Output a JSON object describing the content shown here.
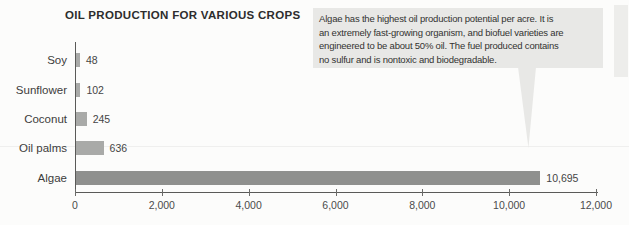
{
  "chart_data": {
    "type": "bar",
    "orientation": "horizontal",
    "title": "OIL PRODUCTION FOR VARIOUS CROPS",
    "categories": [
      "Soy",
      "Sunflower",
      "Coconut",
      "Oil palms",
      "Algae"
    ],
    "values": [
      48,
      102,
      245,
      636,
      10695
    ],
    "value_labels": [
      "48",
      "102",
      "245",
      "636",
      "10,695"
    ],
    "xlabel": "",
    "ylabel": "",
    "xlim": [
      0,
      12000
    ],
    "x_ticks": [
      0,
      2000,
      4000,
      6000,
      8000,
      10000,
      12000
    ],
    "x_tick_labels": [
      "0",
      "2,000",
      "4,000",
      "6,000",
      "8,000",
      "10,000",
      "12,000"
    ],
    "grid": false,
    "legend": false
  },
  "callout": {
    "lines": [
      "Algae has the highest oil production potential per acre. It is",
      "an extremely fast-growing organism, and biofuel varieties are",
      "engineered to be about 50% oil. The fuel produced contains",
      "no sulfur and is nontoxic and biodegradable."
    ]
  },
  "colors": {
    "bar": "#a9aaa8",
    "algae_bar": "#8f908e",
    "callout_bg": "#e8e8e6",
    "axis": "#5a5a58",
    "page_bg": "#fcfcfb"
  }
}
